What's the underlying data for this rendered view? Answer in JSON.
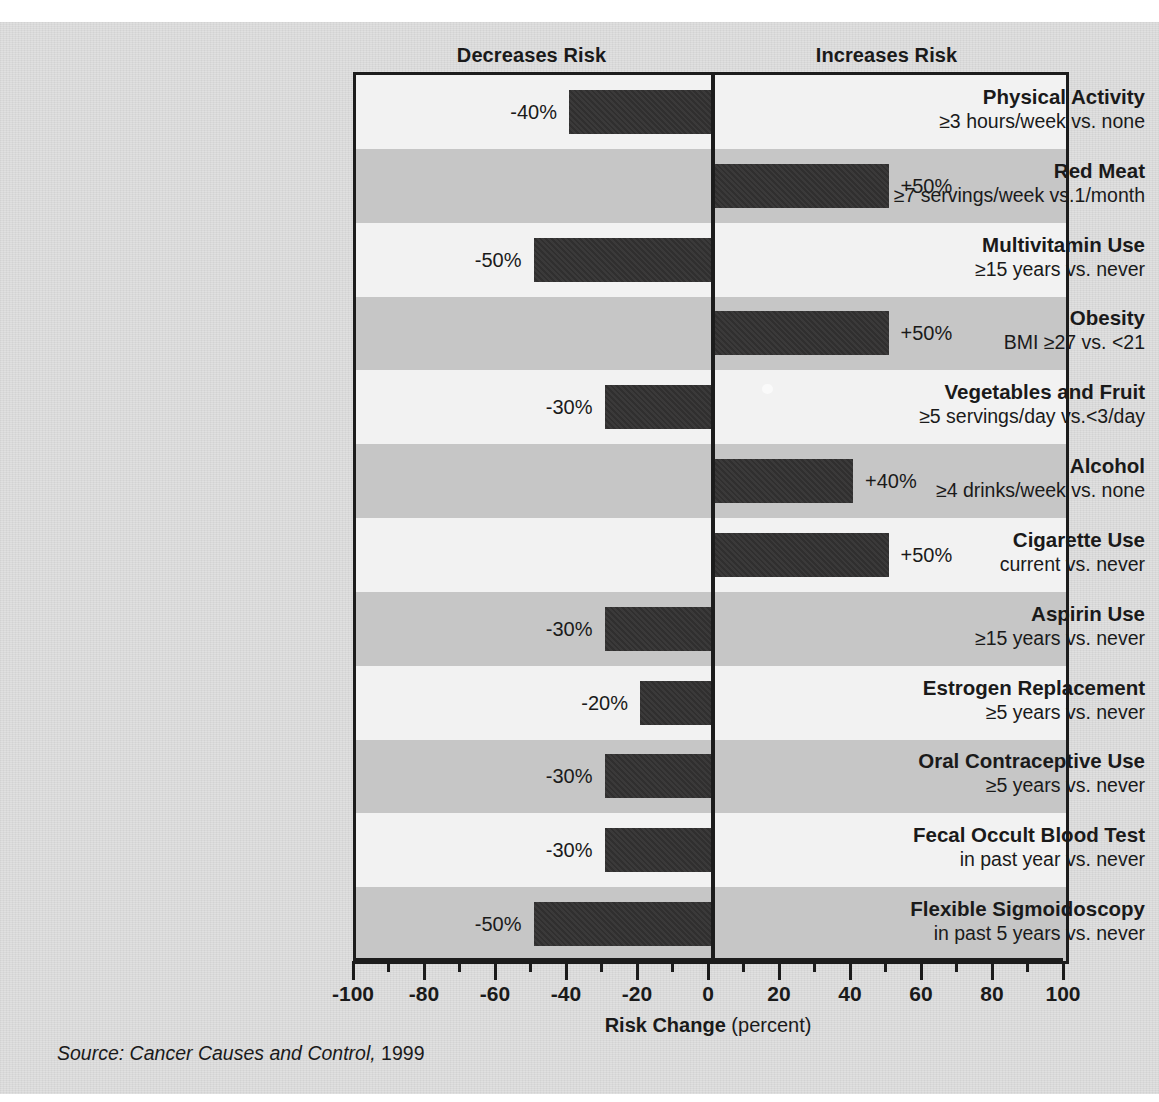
{
  "headers": {
    "decreases": "Decreases Risk",
    "increases": "Increases Risk"
  },
  "axis": {
    "title_main": "Risk Change",
    "title_unit": "(percent)",
    "ticks": [
      "-100",
      "-80",
      "-60",
      "-40",
      "-20",
      "0",
      "20",
      "40",
      "60",
      "80",
      "100"
    ]
  },
  "source": {
    "italic": "Source: Cancer Causes and Control,",
    "year": "1999"
  },
  "colors": {
    "background": "#d9d9d9",
    "row_light": "#f2f2f2",
    "row_dark": "#c6c6c6",
    "bar": "#302f2f",
    "axis": "#1c1c1c",
    "text": "#1a1a1a"
  },
  "chart_data": {
    "type": "bar",
    "orientation": "horizontal",
    "title": "",
    "xlabel": "Risk Change (percent)",
    "ylabel": "",
    "xlim": [
      -100,
      100
    ],
    "xticks": [
      -100,
      -80,
      -60,
      -40,
      -20,
      0,
      20,
      40,
      60,
      80,
      100
    ],
    "grid": false,
    "legend": false,
    "zero_reference_line": 0,
    "annotations": [
      "Decreases Risk",
      "Increases Risk"
    ],
    "categories": [
      "Physical Activity",
      "Red Meat",
      "Multivitamin Use",
      "Obesity",
      "Vegetables and Fruit",
      "Alcohol",
      "Cigarette Use",
      "Aspirin Use",
      "Estrogen Replacement",
      "Oral Contraceptive Use",
      "Fecal Occult Blood Test",
      "Flexible Sigmoidoscopy"
    ],
    "subtitles": [
      "≥3 hours/week vs. none",
      "≥7 servings/week vs.1/month",
      "≥15 years vs. never",
      "BMI ≥27 vs. <21",
      "≥5 servings/day vs.<3/day",
      "≥4 drinks/week vs. none",
      "current vs. never",
      "≥15 years vs. never",
      "≥5 years vs. never",
      "≥5 years vs. never",
      "in past year vs. never",
      "in past 5 years vs. never"
    ],
    "values": [
      -40,
      50,
      -50,
      50,
      -30,
      40,
      50,
      -30,
      -20,
      -30,
      -30,
      -50
    ],
    "value_labels": [
      "-40%",
      "+50%",
      "-50%",
      "+50%",
      "-30%",
      "+40%",
      "+50%",
      "-30%",
      "-20%",
      "-30%",
      "-30%",
      "-50%"
    ]
  }
}
